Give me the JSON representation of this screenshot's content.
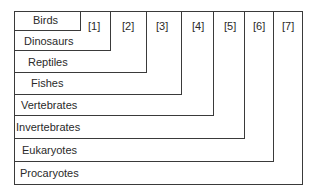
{
  "diagram": {
    "groups": [
      {
        "label": "Birds",
        "marker": "[1]"
      },
      {
        "label": "Dinosaurs",
        "marker": "[2]"
      },
      {
        "label": "Reptiles",
        "marker": "[3]"
      },
      {
        "label": "Fishes",
        "marker": "[4]"
      },
      {
        "label": "Vertebrates",
        "marker": "[5]"
      },
      {
        "label": "Invertebrates",
        "marker": "[6]"
      },
      {
        "label": "Eukaryotes",
        "marker": "[7]"
      },
      {
        "label": "Procaryotes",
        "marker": ""
      }
    ],
    "colors": {
      "line": "#3a3a3a",
      "text": "#2a2a2a",
      "background": "#ffffff"
    }
  }
}
